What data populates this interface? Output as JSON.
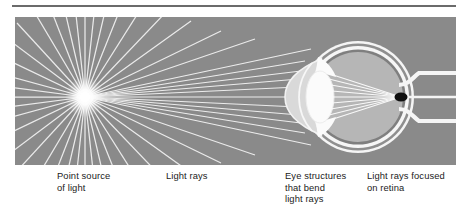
{
  "figure": {
    "title_rule": true,
    "panel": {
      "background_color": "#8a8a8a",
      "width": 441,
      "height": 148
    },
    "captions": [
      {
        "id": "point-source",
        "text": "Point source\nof light"
      },
      {
        "id": "light-rays",
        "text": "Light rays"
      },
      {
        "id": "eye-structures",
        "text": "Eye structures\nthat bend\nlight rays"
      },
      {
        "id": "focused-retina",
        "text": "Light rays focused\non retina"
      }
    ]
  },
  "diagram_data": {
    "type": "optics-ray-diagram",
    "subject": "Human eye focusing light from a point source onto the retina",
    "elements": [
      {
        "name": "point-source-of-light",
        "kind": "radial-light-burst",
        "x": 85,
        "y": 97,
        "ray_count": 44,
        "color": "#ffffff"
      },
      {
        "name": "light-rays",
        "kind": "straight-rays",
        "color": "#f2f2f2",
        "description": "Diverging rays travelling left to right toward the eye"
      },
      {
        "name": "eyeball",
        "kind": "sphere",
        "cx": 358,
        "cy": 97,
        "r": 55,
        "fill": "#b4b4b4",
        "wall_color": "#f5f5f5"
      },
      {
        "name": "cornea",
        "kind": "anterior-bulge",
        "fill": "#d8d8d8"
      },
      {
        "name": "lens",
        "kind": "biconvex-ellipse",
        "cx": 320,
        "cy": 97,
        "rx": 13,
        "ry": 26,
        "fill": "#fafafa"
      },
      {
        "name": "iris",
        "kind": "pair-of-wedges",
        "fill": "#ffffff"
      },
      {
        "name": "retina-focal-point",
        "kind": "focal-point",
        "x": 401,
        "y": 97,
        "color": "#111111"
      },
      {
        "name": "optic-nerve",
        "kind": "tube",
        "from_x": 404,
        "to_x": 456,
        "y": 97,
        "color": "#f5f5f5"
      }
    ],
    "colors": {
      "panel_background": "#8a8a8a",
      "ray": "#f2f2f2",
      "eye_interior": "#b4b4b4",
      "eye_wall": "#f5f5f5",
      "lens": "#fafafa",
      "focal_point": "#111111",
      "caption_text": "#1b1b1b",
      "rule": "#6b6b6b"
    }
  }
}
